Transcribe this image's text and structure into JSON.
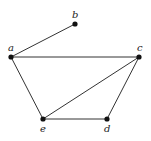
{
  "graph": {
    "nodes": [
      {
        "id": "a",
        "label": "a",
        "x": 11,
        "y": 57,
        "lx": 8,
        "ly": 51
      },
      {
        "id": "b",
        "label": "b",
        "x": 75,
        "y": 24,
        "lx": 72,
        "ly": 18
      },
      {
        "id": "c",
        "label": "c",
        "x": 139,
        "y": 57,
        "lx": 137,
        "ly": 51
      },
      {
        "id": "d",
        "label": "d",
        "x": 107,
        "y": 119,
        "lx": 104,
        "ly": 132
      },
      {
        "id": "e",
        "label": "e",
        "x": 43,
        "y": 119,
        "lx": 40,
        "ly": 132
      }
    ],
    "edges": [
      {
        "from": "a",
        "to": "b"
      },
      {
        "from": "a",
        "to": "c"
      },
      {
        "from": "a",
        "to": "e"
      },
      {
        "from": "c",
        "to": "e"
      },
      {
        "from": "c",
        "to": "d"
      },
      {
        "from": "e",
        "to": "d"
      }
    ],
    "colors": {
      "edge": "#333333",
      "node": "#111111",
      "label": "#222222"
    }
  }
}
